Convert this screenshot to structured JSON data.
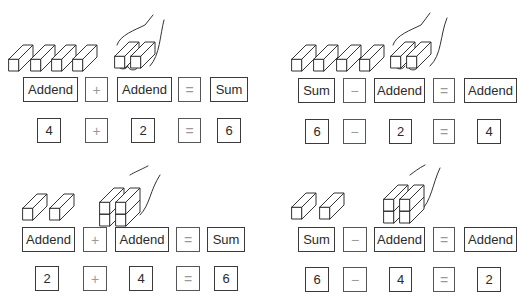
{
  "panels": [
    {
      "id": "addition-4-plus-2",
      "word_row": [
        "Addend",
        "+",
        "Addend",
        "=",
        "Sum"
      ],
      "number_row": [
        "4",
        "+",
        "2",
        "=",
        "6"
      ],
      "illustration": {
        "loose_blocks": 4,
        "blocks_in_hand": 2
      }
    },
    {
      "id": "subtraction-6-minus-2",
      "word_row": [
        "Sum",
        "−",
        "Addend",
        "=",
        "Addend"
      ],
      "number_row": [
        "6",
        "−",
        "2",
        "=",
        "4"
      ],
      "illustration": {
        "loose_blocks": 4,
        "blocks_in_hand": 2
      }
    },
    {
      "id": "addition-2-plus-4",
      "word_row": [
        "Addend",
        "+",
        "Addend",
        "=",
        "Sum"
      ],
      "number_row": [
        "2",
        "+",
        "4",
        "=",
        "6"
      ],
      "illustration": {
        "loose_blocks": 2,
        "blocks_in_hand": 4
      }
    },
    {
      "id": "subtraction-6-minus-4",
      "word_row": [
        "Sum",
        "−",
        "Addend",
        "=",
        "Addend"
      ],
      "number_row": [
        "6",
        "−",
        "4",
        "=",
        "2"
      ],
      "illustration": {
        "loose_blocks": 2,
        "blocks_in_hand": 4
      }
    }
  ],
  "colors": {
    "box_border": "#3a3a3a",
    "operator_text": "#9a9a9a",
    "text": "#2a2a2a",
    "background": "#ffffff"
  }
}
